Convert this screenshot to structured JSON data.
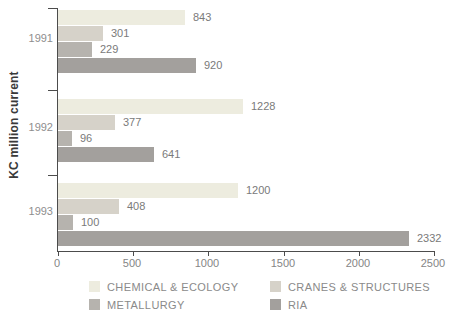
{
  "chart_data": {
    "type": "bar",
    "orientation": "horizontal",
    "title": "",
    "xlabel": "",
    "ylabel": "KC million current",
    "categories": [
      "1991",
      "1992",
      "1993"
    ],
    "series": [
      {
        "name": "CHEMICAL & ECOLOGY",
        "color": "#edecdf",
        "values": [
          843,
          1228,
          1200
        ]
      },
      {
        "name": "CRANES & STRUCTURES",
        "color": "#d6d2c9",
        "values": [
          301,
          377,
          408
        ]
      },
      {
        "name": "METALLURGY",
        "color": "#b6b3ae",
        "values": [
          229,
          96,
          100
        ]
      },
      {
        "name": "RIA",
        "color": "#a3a09d",
        "values": [
          920,
          641,
          2332
        ]
      }
    ],
    "xlim": [
      0,
      2500
    ],
    "x_ticks": [
      0,
      500,
      1000,
      1500,
      2000,
      2500
    ],
    "grid": false,
    "bar_value_labels": true,
    "legend_position": "bottom"
  },
  "colors": {
    "axis": "#4c4c4c",
    "value_label_text": "#7a7a7a",
    "tick_label_text": "#858585",
    "year_label_text": "#8e8e8e",
    "legend_text": "#8a8a8a",
    "ylabel_text": "#3a3a3a",
    "background": "#ffffff"
  }
}
